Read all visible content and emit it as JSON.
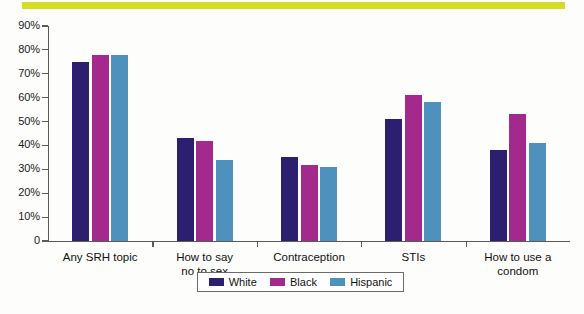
{
  "decor": {
    "top_rule_color": "#d4de23"
  },
  "chart_data": {
    "type": "bar",
    "title": "",
    "subtitle": "",
    "xlabel": "",
    "ylabel": "",
    "ylim": [
      0,
      90
    ],
    "grid": false,
    "legend_position": "bottom",
    "categories": [
      "Any SRH topic",
      "How to say no to sex",
      "Contraception",
      "STIs",
      "How to use a condom"
    ],
    "category_lines": [
      [
        "Any SRH topic"
      ],
      [
        "How to say",
        "no to sex"
      ],
      [
        "Contraception"
      ],
      [
        "STIs"
      ],
      [
        "How to use a",
        "condom"
      ]
    ],
    "series": [
      {
        "name": "White",
        "color": "#2d1f70",
        "values": [
          75,
          43,
          35,
          51,
          38
        ]
      },
      {
        "name": "Black",
        "color": "#a32a8c",
        "values": [
          78,
          42,
          32,
          61,
          53
        ]
      },
      {
        "name": "Hispanic",
        "color": "#4f91bd",
        "values": [
          78,
          34,
          31,
          58,
          41
        ]
      }
    ],
    "ytick_labels": [
      "90%",
      "80%",
      "70%",
      "60%",
      "50%",
      "40%",
      "30%",
      "20%",
      "10%",
      "0"
    ],
    "ytick_values": [
      90,
      80,
      70,
      60,
      50,
      40,
      30,
      20,
      10,
      0
    ]
  },
  "legend": {
    "items": [
      {
        "label": "White",
        "color": "#2d1f70"
      },
      {
        "label": "Black",
        "color": "#a32a8c"
      },
      {
        "label": "Hispanic",
        "color": "#4f91bd"
      }
    ]
  }
}
